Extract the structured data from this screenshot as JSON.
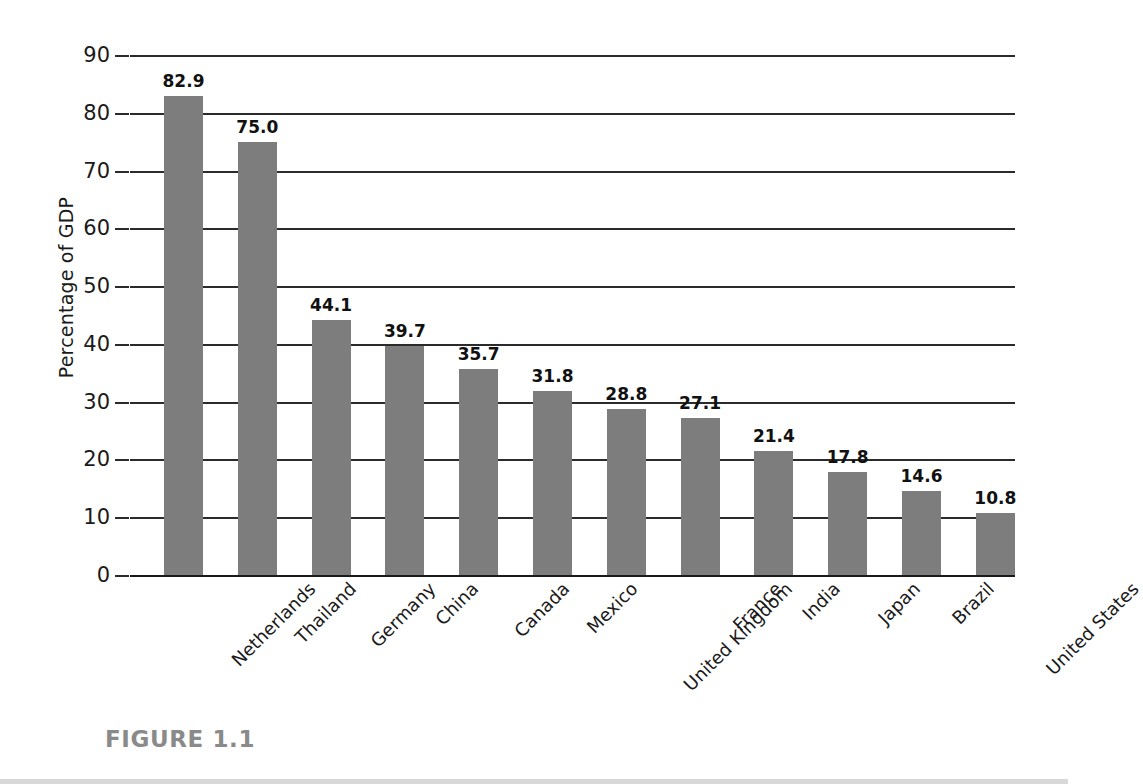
{
  "figure": {
    "caption": "FIGURE 1.1",
    "bar_color": "#7d7d7d",
    "axis_color": "#2b2b2b",
    "caption_color": "#8a8a8a"
  },
  "chart_data": {
    "type": "bar",
    "title": "",
    "subtitle": "",
    "xlabel": "",
    "ylabel": "Percentage of GDP",
    "ylim": [
      0,
      90
    ],
    "ytick_interval": 10,
    "ytick_labels": [
      "90",
      "80",
      "70",
      "60",
      "50",
      "40",
      "30",
      "20",
      "10",
      "0"
    ],
    "ytick_values": [
      90,
      80,
      70,
      60,
      50,
      40,
      30,
      20,
      10,
      0
    ],
    "grid": "horizontal",
    "legend": "none",
    "orientation": "vertical",
    "categories": [
      "Netherlands",
      "Thailand",
      "Germany",
      "China",
      "Canada",
      "Mexico",
      "United Kingdom",
      "France",
      "India",
      "Japan",
      "Brazil",
      "United States"
    ],
    "values": [
      82.9,
      75.0,
      44.1,
      39.7,
      35.7,
      31.8,
      28.8,
      27.1,
      21.4,
      17.8,
      14.6,
      10.8
    ],
    "value_labels": [
      "82.9",
      "75.0",
      "44.1",
      "39.7",
      "35.7",
      "31.8",
      "28.8",
      "27.1",
      "21.4",
      "17.8",
      "14.6",
      "10.8"
    ]
  }
}
